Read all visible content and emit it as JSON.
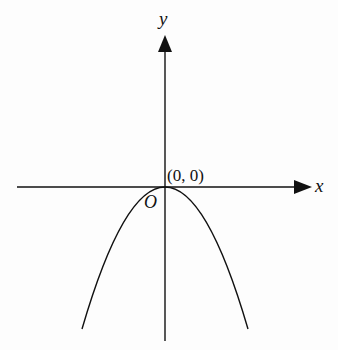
{
  "diagram": {
    "type": "parabola-graph",
    "axes": {
      "x_label": "x",
      "y_label": "y",
      "origin_label": "O"
    },
    "vertex_label": "(0, 0)",
    "curve": "downward-opening parabola with vertex at origin"
  },
  "colors": {
    "stroke": "#111111",
    "background": "#fdfdfd"
  }
}
